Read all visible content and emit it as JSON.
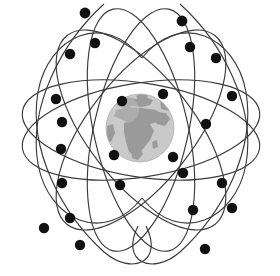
{
  "figure": {
    "name": "gps-satellite-constellation",
    "background_color": "#ffffff",
    "canvas": {
      "width": 280,
      "height": 276
    }
  },
  "colors": {
    "orbit_stroke": "#3a3a3a",
    "satellite_fill": "#111111",
    "ocean": "#c9c9c9",
    "land": "#9a9a9a",
    "globe_shadow": "#b4b4b4",
    "globe_highlight": "#d6d6d6"
  },
  "globe": {
    "label": "earth",
    "center_x": 140,
    "center_y": 128,
    "radius": 34,
    "visible_region": "Europe, Africa, Middle East"
  },
  "nodes": {
    "top": {
      "x": 142,
      "y": 58
    },
    "bottom": {
      "x": 142,
      "y": 198
    },
    "left": {
      "x": 25,
      "y": 134
    },
    "right": {
      "x": 265,
      "y": 135
    }
  },
  "orbits": [
    {
      "id": "orbit-1",
      "rx": 120,
      "ry": 46,
      "rotation": 10
    },
    {
      "id": "orbit-2",
      "rx": 120,
      "ry": 46,
      "rotation": -10
    },
    {
      "id": "orbit-3",
      "rx": 46,
      "ry": 122,
      "rotation": 14
    },
    {
      "id": "orbit-4",
      "rx": 46,
      "ry": 122,
      "rotation": -14
    },
    {
      "id": "orbit-5",
      "rx": 52,
      "ry": 118,
      "rotation": 40
    },
    {
      "id": "orbit-6",
      "rx": 52,
      "ry": 118,
      "rotation": -40
    }
  ],
  "satellites": [
    {
      "id": "sat-01",
      "x": 85,
      "y": 13,
      "r": 5.4
    },
    {
      "id": "sat-02",
      "x": 182,
      "y": 21,
      "r": 5.4
    },
    {
      "id": "sat-03",
      "x": 95,
      "y": 43,
      "r": 5.2
    },
    {
      "id": "sat-04",
      "x": 190,
      "y": 47,
      "r": 5.2
    },
    {
      "id": "sat-05",
      "x": 70,
      "y": 54,
      "r": 5.2
    },
    {
      "id": "sat-06",
      "x": 216,
      "y": 58,
      "r": 5.2
    },
    {
      "id": "sat-07",
      "x": 56,
      "y": 99,
      "r": 5.2
    },
    {
      "id": "sat-08",
      "x": 232,
      "y": 96,
      "r": 5.2
    },
    {
      "id": "sat-09",
      "x": 122,
      "y": 101,
      "r": 5.2
    },
    {
      "id": "sat-10",
      "x": 163,
      "y": 94,
      "r": 5.2
    },
    {
      "id": "sat-11",
      "x": 62,
      "y": 122,
      "r": 5.2
    },
    {
      "id": "sat-12",
      "x": 206,
      "y": 124,
      "r": 5.2
    },
    {
      "id": "sat-13",
      "x": 61,
      "y": 149,
      "r": 5.2
    },
    {
      "id": "sat-14",
      "x": 114,
      "y": 155,
      "r": 5.2
    },
    {
      "id": "sat-15",
      "x": 173,
      "y": 157,
      "r": 5.2
    },
    {
      "id": "sat-16",
      "x": 183,
      "y": 173,
      "r": 5.2
    },
    {
      "id": "sat-17",
      "x": 222,
      "y": 183,
      "r": 5.2
    },
    {
      "id": "sat-18",
      "x": 62,
      "y": 183,
      "r": 5.2
    },
    {
      "id": "sat-19",
      "x": 120,
      "y": 185,
      "r": 5.2
    },
    {
      "id": "sat-20",
      "x": 70,
      "y": 218,
      "r": 5.2
    },
    {
      "id": "sat-21",
      "x": 193,
      "y": 210,
      "r": 5.2
    },
    {
      "id": "sat-22",
      "x": 44,
      "y": 228,
      "r": 5.2
    },
    {
      "id": "sat-23",
      "x": 232,
      "y": 208,
      "r": 5.2
    },
    {
      "id": "sat-24",
      "x": 80,
      "y": 245,
      "r": 5.2
    },
    {
      "id": "sat-25",
      "x": 205,
      "y": 249,
      "r": 5.2
    }
  ],
  "counts": {
    "satellite_count": 25,
    "orbit_count": 6
  }
}
